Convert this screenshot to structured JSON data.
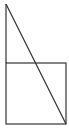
{
  "diagram": {
    "background": "#ffffff",
    "stroke_color": "#333333",
    "stroke_width": 1.2,
    "square": {
      "x": 6,
      "y": 63,
      "width": 60,
      "height": 61
    },
    "vertical_line": {
      "x1": 6,
      "y1": 4,
      "x2": 6,
      "y2": 63
    },
    "diagonal_line": {
      "x1": 6,
      "y1": 4,
      "x2": 66,
      "y2": 124
    }
  }
}
